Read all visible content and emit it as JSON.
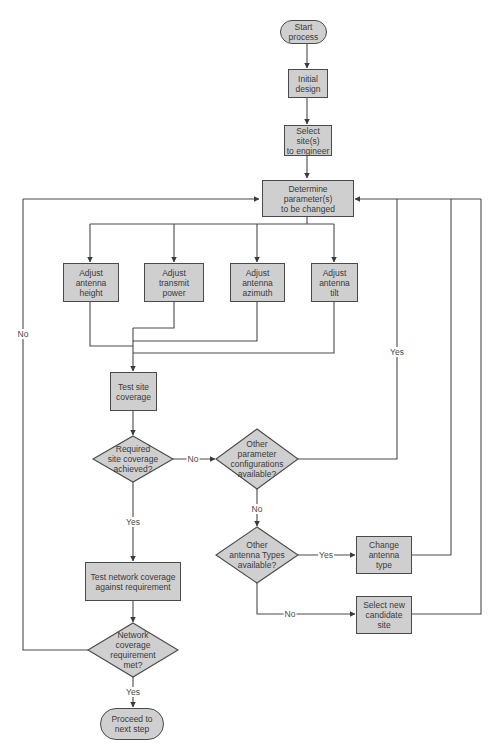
{
  "diagram": {
    "type": "flowchart",
    "colors": {
      "node_fill": "#cfcfcf",
      "node_border": "#4a4a4a",
      "line": "#4a4a4a",
      "text": "#3a3a3a",
      "background": "#ffffff"
    },
    "nodes": {
      "start": {
        "label": "Start\nprocess",
        "shape": "terminator"
      },
      "initial_design": {
        "label": "Initial\ndesign",
        "shape": "process"
      },
      "select_sites": {
        "label": "Select site(s)\nto engineer",
        "shape": "process"
      },
      "determine_params": {
        "label": "Determine\nparameter(s)\nto be changed",
        "shape": "process"
      },
      "adjust_height": {
        "label": "Adjust\nantenna\nheight",
        "shape": "process"
      },
      "adjust_power": {
        "label": "Adjust\ntransmit\npower",
        "shape": "process"
      },
      "adjust_azimuth": {
        "label": "Adjust\nantenna\nazimuth",
        "shape": "process"
      },
      "adjust_tilt": {
        "label": "Adjust\nantenna\ntilt",
        "shape": "process"
      },
      "test_site": {
        "label": "Test site\ncoverage",
        "shape": "process"
      },
      "site_ok": {
        "label": "Required\nsite coverage\nachieved?",
        "shape": "decision"
      },
      "other_params": {
        "label": "Other\nparameter\nconfigurations\navailable?",
        "shape": "decision"
      },
      "other_antenna": {
        "label": "Other\nantenna Types\navailable?",
        "shape": "decision"
      },
      "change_antenna": {
        "label": "Change\nantenna\ntype",
        "shape": "process"
      },
      "new_site": {
        "label": "Select new\ncandidate\nsite",
        "shape": "process"
      },
      "test_network": {
        "label": "Test network coverage\nagainst requirement",
        "shape": "process"
      },
      "network_ok": {
        "label": "Network\ncoverage\nrequirement\nmet?",
        "shape": "decision"
      },
      "proceed": {
        "label": "Proceed to\nnext step",
        "shape": "terminator"
      }
    },
    "edge_labels": {
      "site_no": "No",
      "site_yes": "Yes",
      "params_yes": "Yes",
      "params_no": "No",
      "antenna_yes": "Yes",
      "antenna_no": "No",
      "network_no": "No",
      "network_yes": "Yes"
    }
  }
}
